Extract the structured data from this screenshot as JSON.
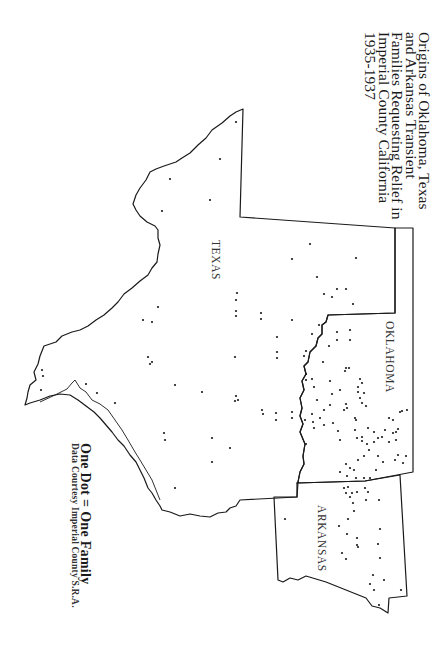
{
  "title": {
    "lines": [
      "Origins of Oklahoma, Texas",
      "and Arkansas Transient",
      "Families Requesting Relief in",
      "Imperial County California",
      "1935-1937"
    ]
  },
  "states": [
    {
      "name": "TEXAS",
      "label": "TEXAS"
    },
    {
      "name": "OKLAHOMA",
      "label": "OKLAHOMA"
    },
    {
      "name": "ARKANSAS",
      "label": "ARKANSAS"
    }
  ],
  "legend": {
    "key": "One Dot = One Family",
    "source": "Data Courtesy Imperial County S.R.A."
  },
  "colors": {
    "ink": "#1a1a1a",
    "background": "#ffffff"
  },
  "dots": [
    [
      236,
      122
    ],
    [
      220,
      159
    ],
    [
      170,
      179
    ],
    [
      210,
      200
    ],
    [
      162,
      211
    ],
    [
      310,
      244
    ],
    [
      292,
      259
    ],
    [
      356,
      258
    ],
    [
      324,
      294
    ],
    [
      237,
      293
    ],
    [
      236,
      300
    ],
    [
      236,
      311
    ],
    [
      236,
      316
    ],
    [
      261,
      313
    ],
    [
      261,
      319
    ],
    [
      292,
      320
    ],
    [
      337,
      289
    ],
    [
      353,
      304
    ],
    [
      158,
      307
    ],
    [
      143,
      320
    ],
    [
      152,
      322
    ],
    [
      277,
      337
    ],
    [
      277,
      352
    ],
    [
      277,
      358
    ],
    [
      148,
      357
    ],
    [
      152,
      362
    ],
    [
      150,
      364
    ],
    [
      235,
      357
    ],
    [
      42,
      370
    ],
    [
      43,
      376
    ],
    [
      41,
      390
    ],
    [
      86,
      384
    ],
    [
      97,
      393
    ],
    [
      175,
      385
    ],
    [
      202,
      392
    ],
    [
      236,
      396
    ],
    [
      238,
      400
    ],
    [
      235,
      401
    ],
    [
      262,
      410
    ],
    [
      263,
      414
    ],
    [
      276,
      413
    ],
    [
      276,
      420
    ],
    [
      292,
      412
    ],
    [
      292,
      418
    ],
    [
      115,
      403
    ],
    [
      212,
      438
    ],
    [
      230,
      448
    ],
    [
      164,
      433
    ],
    [
      165,
      440
    ],
    [
      212,
      462
    ],
    [
      175,
      488
    ],
    [
      317,
      277
    ],
    [
      332,
      297
    ],
    [
      346,
      289
    ],
    [
      319,
      325
    ],
    [
      312,
      334
    ],
    [
      337,
      332
    ],
    [
      337,
      340
    ],
    [
      350,
      330
    ],
    [
      350,
      340
    ],
    [
      329,
      346
    ],
    [
      323,
      362
    ],
    [
      306,
      351
    ],
    [
      304,
      356
    ],
    [
      306,
      374
    ],
    [
      306,
      380
    ],
    [
      312,
      379
    ],
    [
      314,
      387
    ],
    [
      330,
      381
    ],
    [
      332,
      394
    ],
    [
      340,
      390
    ],
    [
      346,
      368
    ],
    [
      345,
      371
    ],
    [
      349,
      368
    ],
    [
      358,
      387
    ],
    [
      317,
      400
    ],
    [
      320,
      418
    ],
    [
      312,
      414
    ],
    [
      313,
      422
    ],
    [
      314,
      428
    ],
    [
      324,
      410
    ],
    [
      324,
      425
    ],
    [
      305,
      420
    ],
    [
      306,
      444
    ],
    [
      330,
      405
    ],
    [
      333,
      423
    ],
    [
      344,
      410
    ],
    [
      346,
      404
    ],
    [
      347,
      408
    ],
    [
      355,
      418
    ],
    [
      356,
      420
    ],
    [
      360,
      379
    ],
    [
      362,
      383
    ],
    [
      358,
      392
    ],
    [
      360,
      398
    ],
    [
      362,
      403
    ],
    [
      364,
      393
    ],
    [
      366,
      406
    ],
    [
      340,
      440
    ],
    [
      338,
      431
    ],
    [
      355,
      430
    ],
    [
      357,
      438
    ],
    [
      362,
      437
    ],
    [
      362,
      441
    ],
    [
      368,
      428
    ],
    [
      367,
      444
    ],
    [
      369,
      450
    ],
    [
      374,
      432
    ],
    [
      378,
      438
    ],
    [
      374,
      442
    ],
    [
      382,
      437
    ],
    [
      385,
      430
    ],
    [
      389,
      418
    ],
    [
      393,
      420
    ],
    [
      378,
      456
    ],
    [
      383,
      462
    ],
    [
      395,
      460
    ],
    [
      403,
      463
    ],
    [
      406,
      456
    ],
    [
      346,
      464
    ],
    [
      350,
      468
    ],
    [
      354,
      470
    ],
    [
      340,
      472
    ],
    [
      347,
      476
    ],
    [
      356,
      478
    ],
    [
      364,
      478
    ],
    [
      370,
      478
    ],
    [
      376,
      470
    ],
    [
      364,
      456
    ],
    [
      358,
      460
    ],
    [
      393,
      433
    ],
    [
      396,
      440
    ],
    [
      389,
      442
    ],
    [
      398,
      429
    ],
    [
      396,
      432
    ],
    [
      407,
      410
    ],
    [
      402,
      411
    ],
    [
      398,
      455
    ],
    [
      344,
      488
    ],
    [
      348,
      487
    ],
    [
      352,
      493
    ],
    [
      346,
      493
    ],
    [
      350,
      497
    ],
    [
      357,
      492
    ],
    [
      365,
      488
    ],
    [
      368,
      492
    ],
    [
      366,
      500
    ],
    [
      353,
      503
    ],
    [
      354,
      511
    ],
    [
      348,
      519
    ],
    [
      379,
      500
    ],
    [
      380,
      529
    ],
    [
      378,
      544
    ],
    [
      380,
      558
    ],
    [
      384,
      580
    ],
    [
      285,
      519
    ],
    [
      339,
      526
    ],
    [
      347,
      534
    ],
    [
      357,
      538
    ],
    [
      357,
      545
    ],
    [
      358,
      547
    ],
    [
      342,
      553
    ],
    [
      346,
      559
    ],
    [
      373,
      575
    ],
    [
      370,
      584
    ],
    [
      374,
      590
    ],
    [
      401,
      590
    ],
    [
      379,
      605
    ],
    [
      400,
      412
    ]
  ]
}
